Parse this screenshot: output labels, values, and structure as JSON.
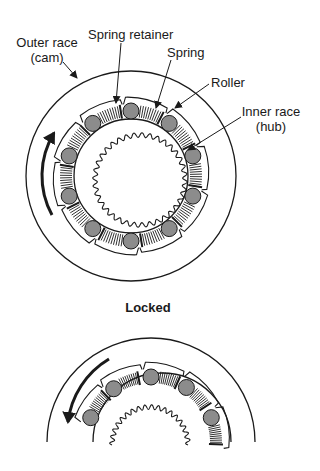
{
  "diagram": {
    "labels": {
      "outer_race_line1": "Outer race",
      "outer_race_line2": "(cam)",
      "spring_retainer": "Spring retainer",
      "spring": "Spring",
      "roller": "Roller",
      "inner_race_line1": "Inner race",
      "inner_race_line2": "(hub)"
    },
    "caption_locked": "Locked",
    "colors": {
      "line": "#1a1a1a",
      "roller_fill": "#8c8c8c",
      "background": "#ffffff"
    },
    "top_view": {
      "state": "Locked",
      "rotation_arrow": "counter-clockwise (upward on left side)",
      "roller_count": 10
    },
    "bottom_view": {
      "rotation_arrow": "counter-clockwise (downward on left side)",
      "roller_count_visible": 5
    }
  }
}
